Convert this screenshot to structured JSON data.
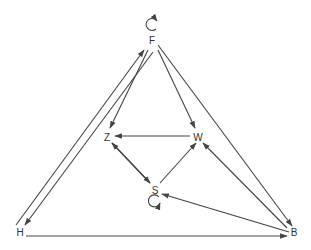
{
  "diagram": {
    "type": "directed-graph",
    "line_color": "#444444",
    "nodes": [
      {
        "id": "F",
        "label": "F"
      },
      {
        "id": "Z",
        "label": "Z"
      },
      {
        "id": "W",
        "label": "W"
      },
      {
        "id": "S",
        "label": "S"
      },
      {
        "id": "H",
        "label": "H"
      },
      {
        "id": "B",
        "label": "B"
      }
    ],
    "edges": [
      {
        "from": "F",
        "to": "F",
        "kind": "self-loop"
      },
      {
        "from": "F",
        "to": "Z"
      },
      {
        "from": "F",
        "to": "W"
      },
      {
        "from": "F",
        "to": "H"
      },
      {
        "from": "H",
        "to": "F"
      },
      {
        "from": "F",
        "to": "B"
      },
      {
        "from": "B",
        "to": "W"
      },
      {
        "from": "W",
        "to": "Z"
      },
      {
        "from": "Z",
        "to": "S"
      },
      {
        "from": "S",
        "to": "Z"
      },
      {
        "from": "S",
        "to": "W"
      },
      {
        "from": "B",
        "to": "S"
      },
      {
        "from": "H",
        "to": "B"
      },
      {
        "from": "S",
        "to": "S",
        "kind": "self-loop"
      }
    ]
  }
}
